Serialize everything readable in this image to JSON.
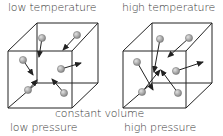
{
  "labels": {
    "left_top": "low temperature",
    "right_top": "high temperature",
    "center_bottom": "constant volume",
    "left_bottom": "low pressure",
    "right_bottom": "high pressure"
  },
  "colors": {
    "line": "#222222",
    "molecule": "#9a9a9a",
    "molecule_highlight": "#d6d6d6",
    "text": "#3a3a3a"
  },
  "cubes": [
    {
      "name": "low-temperature-cube",
      "front": [
        [
          8,
          51
        ],
        [
          72,
          51
        ],
        [
          72,
          108
        ],
        [
          8,
          108
        ]
      ],
      "back": [
        [
          37,
          23
        ],
        [
          98,
          23
        ],
        [
          98,
          83
        ],
        [
          37,
          83
        ]
      ],
      "molecules": [
        {
          "ball": [
            42,
            38
          ],
          "arrow_to": [
            39,
            57
          ]
        },
        {
          "ball": [
            77,
            35
          ],
          "arrow_to": [
            63,
            50
          ]
        },
        {
          "ball": [
            23,
            60
          ],
          "arrow_to": [
            33,
            75
          ]
        },
        {
          "ball": [
            61,
            69
          ],
          "arrow_to": [
            81,
            63
          ]
        },
        {
          "ball": [
            28,
            90
          ],
          "arrow_to": [
            37,
            80
          ]
        },
        {
          "ball": [
            64,
            93
          ],
          "arrow_to": [
            52,
            79
          ]
        }
      ]
    },
    {
      "name": "high-temperature-cube",
      "front": [
        [
          123,
          51
        ],
        [
          186,
          51
        ],
        [
          186,
          108
        ],
        [
          123,
          108
        ]
      ],
      "back": [
        [
          152,
          23
        ],
        [
          212,
          23
        ],
        [
          212,
          83
        ],
        [
          152,
          83
        ]
      ],
      "molecules": [
        {
          "ball": [
            160,
            39
          ],
          "arrow_to": [
            154,
            72
          ]
        },
        {
          "ball": [
            189,
            38
          ],
          "arrow_to": [
            168,
            57
          ]
        },
        {
          "ball": [
            137,
            62
          ],
          "arrow_to": [
            153,
            90
          ]
        },
        {
          "ball": [
            176,
            71
          ],
          "arrow_to": [
            203,
            62
          ]
        },
        {
          "ball": [
            142,
            92
          ],
          "arrow_to": [
            160,
            70
          ]
        },
        {
          "ball": [
            178,
            93
          ],
          "arrow_to": [
            161,
            70
          ]
        }
      ]
    }
  ]
}
